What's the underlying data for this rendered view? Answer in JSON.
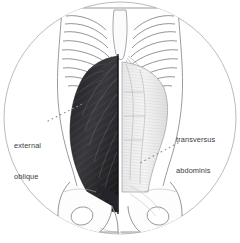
{
  "figure": {
    "kind": "anatomical-illustration",
    "background_color": "#ffffff",
    "frame": {
      "shape": "circle",
      "stroke_color": "#b9bcc0",
      "cropped_bottom": true
    }
  },
  "labels": [
    {
      "id": "external-oblique",
      "line1": "external",
      "line2": "oblique",
      "color": "#3a3a3a",
      "side": "left",
      "leader": "dotted-line-up-right"
    },
    {
      "id": "transversus-abdominis",
      "line1": "transversus",
      "line2": "abdominis",
      "color": "#3a3a3a",
      "side": "right",
      "leader": "dotted-line-down-left"
    }
  ],
  "regions": {
    "ribcage": "rib pairs drawn as stacked curved outlines on both sides of sternum",
    "left_muscle": "external oblique, shaded dark with diagonal fiber striations",
    "right_muscle": "transversus abdominis, pale with transverse fiber striations",
    "midline": "linea alba vertical division",
    "pelvis": "iliac crests, pubic arch and obturator foramina outlines"
  },
  "colors": {
    "dark_muscle": "#2b2b2e",
    "mid_muscle": "#6f6f74",
    "light_muscle": "#d8d8da",
    "outline": "#6e7175",
    "frame": "#b9bcc0",
    "text": "#3a3a3a"
  }
}
